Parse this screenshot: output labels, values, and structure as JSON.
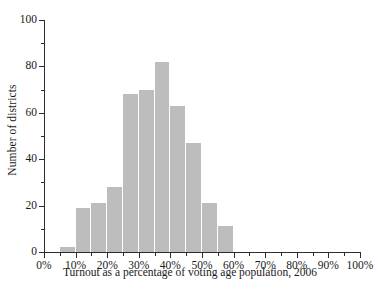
{
  "chart_data": {
    "type": "bar",
    "title": "",
    "xlabel": "Turnout as a percentage of voting age population, 2006",
    "ylabel": "Number of districts",
    "bin_width": 5,
    "categories": [
      "5-10%",
      "10-15%",
      "15-20%",
      "20-25%",
      "25-30%",
      "30-35%",
      "35-40%",
      "40-45%",
      "45-50%",
      "50-55%",
      "55-60%"
    ],
    "bin_starts": [
      5,
      10,
      15,
      20,
      25,
      30,
      35,
      40,
      45,
      50,
      55
    ],
    "values": [
      2,
      19,
      21,
      28,
      68,
      70,
      82,
      63,
      47,
      21,
      11
    ],
    "xlim": [
      0,
      100
    ],
    "ylim": [
      0,
      100
    ],
    "grid": false,
    "legend": null,
    "bar_color": "#bdbdbd",
    "axis_color": "#2b2b2b",
    "y_ticks_major": [
      0,
      20,
      40,
      60,
      80,
      100
    ],
    "y_ticks_minor": [
      10,
      30,
      50,
      70,
      90
    ],
    "y_tick_labels": [
      "0",
      "20",
      "40",
      "60",
      "80",
      "100"
    ],
    "x_ticks_major": [
      0,
      10,
      20,
      30,
      40,
      50,
      60,
      70,
      80,
      90,
      100
    ],
    "x_ticks_minor": [
      5,
      15,
      25,
      35,
      45,
      55,
      65,
      75,
      85,
      95
    ],
    "x_tick_labels": [
      "0%",
      "10%",
      "20%",
      "30%",
      "40%",
      "50%",
      "60%",
      "70%",
      "80%",
      "90%",
      "100%"
    ]
  }
}
